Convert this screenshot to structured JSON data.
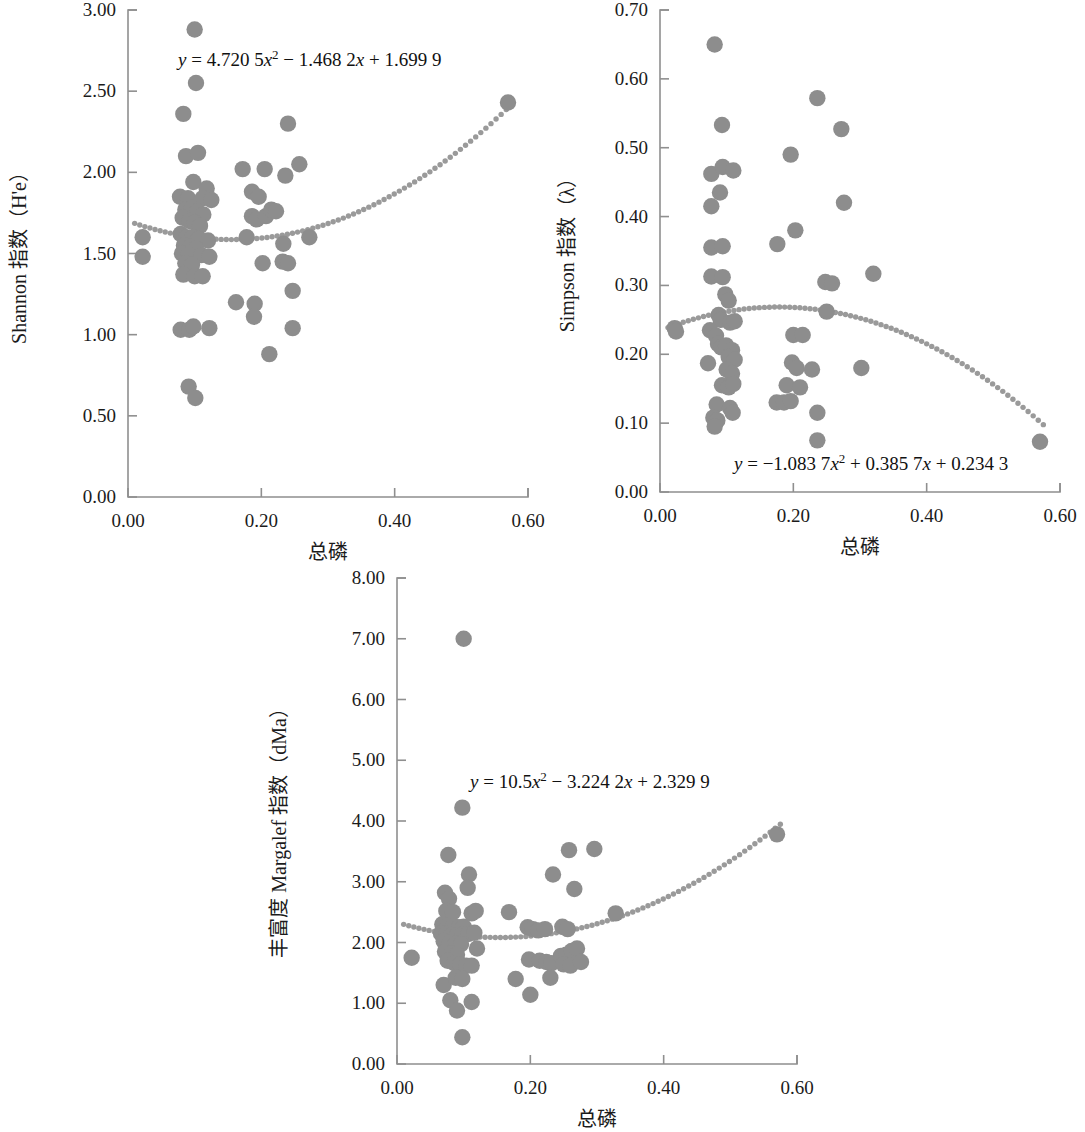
{
  "figure": {
    "marker_color": "#8d8d8d",
    "trend_color": "#9a9a9a",
    "axis_color": "#8f8f8f",
    "background": "#ffffff"
  },
  "chart_data": [
    {
      "type": "scatter",
      "id": "shannon",
      "title": "",
      "xlabel": "总磷",
      "ylabel": "Shannon 指数（H'e）",
      "ylabel_parts": [
        "Shannon 指数（H'e）"
      ],
      "xlim": [
        0.0,
        0.6
      ],
      "ylim": [
        0.0,
        3.0
      ],
      "xticks": [
        "0.00",
        "0.20",
        "0.40",
        "0.60"
      ],
      "xtick_values": [
        0.0,
        0.2,
        0.4,
        0.6
      ],
      "yticks": [
        "0.00",
        "0.50",
        "1.00",
        "1.50",
        "2.00",
        "2.50",
        "3.00"
      ],
      "ytick_values": [
        0.0,
        0.5,
        1.0,
        1.5,
        2.0,
        2.5,
        3.0
      ],
      "grid": false,
      "legend": "none",
      "annotation": "y = 4.720 5x² − 1.468 2x + 1.699 9",
      "equation": {
        "lhs": "y",
        "eq": "=",
        "a": "4.720 5",
        "xsq": "x",
        "sup": "2",
        "op1": "−",
        "b": "1.468 2",
        "xlin": "x",
        "op2": "+",
        "c": "1.699 9"
      },
      "trend": {
        "a": 4.7205,
        "b": -1.4682,
        "c": 1.6999,
        "x_start": 0.01,
        "x_end": 0.575,
        "style": "dotted"
      },
      "points": [
        [
          0.022,
          1.6
        ],
        [
          0.022,
          1.48
        ],
        [
          0.1,
          2.88
        ],
        [
          0.102,
          2.55
        ],
        [
          0.083,
          2.36
        ],
        [
          0.087,
          2.1
        ],
        [
          0.105,
          2.12
        ],
        [
          0.098,
          1.94
        ],
        [
          0.118,
          1.9
        ],
        [
          0.078,
          1.85
        ],
        [
          0.09,
          1.84
        ],
        [
          0.112,
          1.84
        ],
        [
          0.125,
          1.83
        ],
        [
          0.086,
          1.77
        ],
        [
          0.096,
          1.78
        ],
        [
          0.104,
          1.76
        ],
        [
          0.113,
          1.74
        ],
        [
          0.082,
          1.72
        ],
        [
          0.092,
          1.7
        ],
        [
          0.1,
          1.69
        ],
        [
          0.108,
          1.67
        ],
        [
          0.079,
          1.62
        ],
        [
          0.088,
          1.6
        ],
        [
          0.097,
          1.6
        ],
        [
          0.106,
          1.59
        ],
        [
          0.12,
          1.58
        ],
        [
          0.084,
          1.55
        ],
        [
          0.093,
          1.54
        ],
        [
          0.102,
          1.53
        ],
        [
          0.081,
          1.5
        ],
        [
          0.091,
          1.49
        ],
        [
          0.11,
          1.49
        ],
        [
          0.122,
          1.48
        ],
        [
          0.086,
          1.44
        ],
        [
          0.096,
          1.43
        ],
        [
          0.083,
          1.37
        ],
        [
          0.1,
          1.36
        ],
        [
          0.112,
          1.36
        ],
        [
          0.079,
          1.03
        ],
        [
          0.092,
          1.03
        ],
        [
          0.098,
          1.05
        ],
        [
          0.122,
          1.04
        ],
        [
          0.091,
          0.68
        ],
        [
          0.101,
          0.61
        ],
        [
          0.172,
          2.02
        ],
        [
          0.205,
          2.02
        ],
        [
          0.236,
          1.98
        ],
        [
          0.257,
          2.05
        ],
        [
          0.24,
          2.3
        ],
        [
          0.186,
          1.88
        ],
        [
          0.196,
          1.85
        ],
        [
          0.186,
          1.73
        ],
        [
          0.193,
          1.71
        ],
        [
          0.207,
          1.73
        ],
        [
          0.215,
          1.77
        ],
        [
          0.222,
          1.76
        ],
        [
          0.178,
          1.6
        ],
        [
          0.233,
          1.56
        ],
        [
          0.272,
          1.6
        ],
        [
          0.202,
          1.44
        ],
        [
          0.232,
          1.45
        ],
        [
          0.24,
          1.44
        ],
        [
          0.247,
          1.27
        ],
        [
          0.162,
          1.2
        ],
        [
          0.19,
          1.19
        ],
        [
          0.189,
          1.11
        ],
        [
          0.247,
          1.04
        ],
        [
          0.212,
          0.88
        ],
        [
          0.57,
          2.43
        ]
      ]
    },
    {
      "type": "scatter",
      "id": "simpson",
      "title": "",
      "xlabel": "总磷",
      "ylabel": "Simpson 指数（λ）",
      "xlim": [
        0.0,
        0.6
      ],
      "ylim": [
        0.0,
        0.7
      ],
      "xticks": [
        "0.00",
        "0.20",
        "0.40",
        "0.60"
      ],
      "xtick_values": [
        0.0,
        0.2,
        0.4,
        0.6
      ],
      "yticks": [
        "0.00",
        "0.10",
        "0.20",
        "0.30",
        "0.40",
        "0.50",
        "0.60",
        "0.70"
      ],
      "ytick_values": [
        0.0,
        0.1,
        0.2,
        0.3,
        0.4,
        0.5,
        0.6,
        0.7
      ],
      "grid": false,
      "legend": "none",
      "annotation": "y = −1.083 7x² + 0.385 7x + 0.234 3",
      "equation": {
        "lhs": "y",
        "eq": "=",
        "a": "−1.083 7",
        "xsq": "x",
        "sup": "2",
        "op1": "+",
        "b": "0.385 7",
        "xlin": "x",
        "op2": "+",
        "c": "0.234 3"
      },
      "trend": {
        "a": -1.0837,
        "b": 0.3857,
        "c": 0.2343,
        "x_start": 0.012,
        "x_end": 0.575,
        "style": "dotted"
      },
      "points": [
        [
          0.022,
          0.238
        ],
        [
          0.024,
          0.233
        ],
        [
          0.082,
          0.65
        ],
        [
          0.093,
          0.533
        ],
        [
          0.077,
          0.462
        ],
        [
          0.094,
          0.472
        ],
        [
          0.11,
          0.467
        ],
        [
          0.09,
          0.435
        ],
        [
          0.077,
          0.415
        ],
        [
          0.077,
          0.355
        ],
        [
          0.094,
          0.357
        ],
        [
          0.077,
          0.313
        ],
        [
          0.094,
          0.312
        ],
        [
          0.098,
          0.287
        ],
        [
          0.103,
          0.278
        ],
        [
          0.088,
          0.257
        ],
        [
          0.091,
          0.25
        ],
        [
          0.105,
          0.246
        ],
        [
          0.112,
          0.248
        ],
        [
          0.075,
          0.235
        ],
        [
          0.084,
          0.227
        ],
        [
          0.087,
          0.215
        ],
        [
          0.092,
          0.21
        ],
        [
          0.099,
          0.213
        ],
        [
          0.108,
          0.206
        ],
        [
          0.072,
          0.187
        ],
        [
          0.103,
          0.196
        ],
        [
          0.112,
          0.192
        ],
        [
          0.1,
          0.178
        ],
        [
          0.108,
          0.172
        ],
        [
          0.093,
          0.155
        ],
        [
          0.103,
          0.152
        ],
        [
          0.11,
          0.157
        ],
        [
          0.085,
          0.127
        ],
        [
          0.105,
          0.122
        ],
        [
          0.109,
          0.115
        ],
        [
          0.08,
          0.108
        ],
        [
          0.086,
          0.104
        ],
        [
          0.082,
          0.095
        ],
        [
          0.176,
          0.36
        ],
        [
          0.196,
          0.49
        ],
        [
          0.203,
          0.38
        ],
        [
          0.236,
          0.572
        ],
        [
          0.248,
          0.305
        ],
        [
          0.258,
          0.303
        ],
        [
          0.25,
          0.262
        ],
        [
          0.2,
          0.228
        ],
        [
          0.214,
          0.228
        ],
        [
          0.198,
          0.188
        ],
        [
          0.205,
          0.18
        ],
        [
          0.228,
          0.178
        ],
        [
          0.19,
          0.155
        ],
        [
          0.21,
          0.152
        ],
        [
          0.175,
          0.13
        ],
        [
          0.186,
          0.13
        ],
        [
          0.196,
          0.132
        ],
        [
          0.236,
          0.115
        ],
        [
          0.236,
          0.075
        ],
        [
          0.272,
          0.527
        ],
        [
          0.276,
          0.42
        ],
        [
          0.302,
          0.18
        ],
        [
          0.32,
          0.317
        ],
        [
          0.57,
          0.073
        ]
      ]
    },
    {
      "type": "scatter",
      "id": "margalef",
      "title": "",
      "xlabel": "总磷",
      "ylabel": "丰富度 Margalef 指数（dMa）",
      "xlim": [
        0.0,
        0.6
      ],
      "ylim": [
        0.0,
        8.0
      ],
      "xticks": [
        "0.00",
        "0.20",
        "0.40",
        "0.60"
      ],
      "xtick_values": [
        0.0,
        0.2,
        0.4,
        0.6
      ],
      "yticks": [
        "0.00",
        "1.00",
        "2.00",
        "3.00",
        "4.00",
        "5.00",
        "6.00",
        "7.00",
        "8.00"
      ],
      "ytick_values": [
        0.0,
        1.0,
        2.0,
        3.0,
        4.0,
        5.0,
        6.0,
        7.0,
        8.0
      ],
      "grid": false,
      "legend": "none",
      "annotation": "y = 10.5x² − 3.224 2x + 2.329 9",
      "equation": {
        "lhs": "y",
        "eq": "=",
        "a": "10.5",
        "xsq": "x",
        "sup": "2",
        "op1": "−",
        "b": "3.224 2",
        "xlin": "x",
        "op2": "+",
        "c": "2.329 9"
      },
      "trend": {
        "a": 10.5,
        "b": -3.2242,
        "c": 2.3299,
        "x_start": 0.01,
        "x_end": 0.575,
        "style": "dotted"
      },
      "points": [
        [
          0.022,
          1.75
        ],
        [
          0.1,
          7.0
        ],
        [
          0.098,
          4.22
        ],
        [
          0.077,
          3.44
        ],
        [
          0.108,
          3.12
        ],
        [
          0.106,
          2.9
        ],
        [
          0.072,
          2.82
        ],
        [
          0.078,
          2.72
        ],
        [
          0.074,
          2.52
        ],
        [
          0.084,
          2.5
        ],
        [
          0.112,
          2.48
        ],
        [
          0.118,
          2.52
        ],
        [
          0.068,
          2.3
        ],
        [
          0.076,
          2.28
        ],
        [
          0.085,
          2.27
        ],
        [
          0.093,
          2.25
        ],
        [
          0.1,
          2.26
        ],
        [
          0.066,
          2.15
        ],
        [
          0.074,
          2.14
        ],
        [
          0.082,
          2.12
        ],
        [
          0.09,
          2.12
        ],
        [
          0.098,
          2.13
        ],
        [
          0.107,
          2.14
        ],
        [
          0.116,
          2.16
        ],
        [
          0.07,
          2.02
        ],
        [
          0.079,
          2.0
        ],
        [
          0.088,
          1.98
        ],
        [
          0.096,
          1.97
        ],
        [
          0.072,
          1.85
        ],
        [
          0.081,
          1.82
        ],
        [
          0.09,
          1.8
        ],
        [
          0.12,
          1.9
        ],
        [
          0.076,
          1.7
        ],
        [
          0.086,
          1.66
        ],
        [
          0.095,
          1.64
        ],
        [
          0.104,
          1.62
        ],
        [
          0.112,
          1.62
        ],
        [
          0.07,
          1.3
        ],
        [
          0.088,
          1.42
        ],
        [
          0.098,
          1.4
        ],
        [
          0.08,
          1.05
        ],
        [
          0.09,
          0.88
        ],
        [
          0.112,
          1.02
        ],
        [
          0.098,
          0.44
        ],
        [
          0.168,
          2.5
        ],
        [
          0.178,
          1.4
        ],
        [
          0.196,
          2.25
        ],
        [
          0.204,
          2.22
        ],
        [
          0.212,
          2.2
        ],
        [
          0.222,
          2.22
        ],
        [
          0.198,
          1.72
        ],
        [
          0.2,
          1.14
        ],
        [
          0.214,
          1.7
        ],
        [
          0.224,
          1.68
        ],
        [
          0.232,
          1.66
        ],
        [
          0.23,
          1.42
        ],
        [
          0.234,
          3.12
        ],
        [
          0.258,
          3.52
        ],
        [
          0.266,
          2.88
        ],
        [
          0.248,
          2.26
        ],
        [
          0.256,
          2.22
        ],
        [
          0.246,
          1.78
        ],
        [
          0.254,
          1.8
        ],
        [
          0.262,
          1.86
        ],
        [
          0.27,
          1.9
        ],
        [
          0.25,
          1.64
        ],
        [
          0.26,
          1.62
        ],
        [
          0.276,
          1.68
        ],
        [
          0.296,
          3.54
        ],
        [
          0.328,
          2.48
        ],
        [
          0.57,
          3.78
        ]
      ]
    }
  ]
}
